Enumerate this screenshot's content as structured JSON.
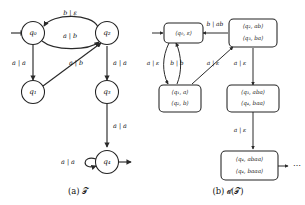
{
  "figure": {
    "panels": [
      {
        "id": "panel-a",
        "caption": "(a) 𝒯",
        "caption_plain": "(a) T",
        "type": "transducer-automaton",
        "states": [
          {
            "id": "q0",
            "label": "q₀",
            "initial": true,
            "accepting": false
          },
          {
            "id": "q1",
            "label": "q₁",
            "initial": false,
            "accepting": false
          },
          {
            "id": "q2",
            "label": "q₂",
            "initial": false,
            "accepting": false
          },
          {
            "id": "q3",
            "label": "q₃",
            "initial": false,
            "accepting": false
          },
          {
            "id": "q4",
            "label": "q₄",
            "initial": false,
            "accepting": true
          }
        ],
        "transitions": [
          {
            "from": "q2",
            "to": "q0",
            "label": "b | ε",
            "input": "b",
            "output": "ε",
            "shape": "curve-top"
          },
          {
            "from": "q0",
            "to": "q2",
            "label": "a | b",
            "input": "a",
            "output": "b",
            "shape": "curve-bottom"
          },
          {
            "from": "q0",
            "to": "q1",
            "label": "a | a",
            "input": "a",
            "output": "a",
            "shape": "straight-down"
          },
          {
            "from": "q1",
            "to": "q2",
            "label": "a | b",
            "input": "a",
            "output": "b",
            "shape": "diagonal-up-right"
          },
          {
            "from": "q2",
            "to": "q3",
            "label": "a | a",
            "input": "a",
            "output": "a",
            "shape": "straight-down"
          },
          {
            "from": "q3",
            "to": "q4",
            "label": "a | a",
            "input": "a",
            "output": "a",
            "shape": "straight-down"
          },
          {
            "from": "q4",
            "to": "q4",
            "label": "a | a",
            "input": "a",
            "output": "a",
            "shape": "self-loop-left"
          }
        ]
      },
      {
        "id": "panel-b",
        "caption": "(b) 𝒹(𝒯)",
        "caption_plain": "(b) D(T)",
        "type": "determinization-tree",
        "nodes": [
          {
            "id": "n0",
            "lines": [
              "⟨q₀, ε⟩"
            ],
            "initial": true
          },
          {
            "id": "n1",
            "lines": [
              "⟨q₂, ab⟩",
              "⟨q₃, ba⟩"
            ],
            "initial": false
          },
          {
            "id": "n2",
            "lines": [
              "⟨q₁, a⟩",
              "⟨q₂, b⟩"
            ],
            "initial": false
          },
          {
            "id": "n3",
            "lines": [
              "⟨q₃, aba⟩",
              "⟨q₄, baa⟩"
            ],
            "initial": false
          },
          {
            "id": "n4",
            "lines": [
              "⟨q₄, abaa⟩",
              "⟨q₄, baaa⟩"
            ],
            "initial": false
          }
        ],
        "edges": [
          {
            "from": "n1",
            "to": "n0",
            "label": "b | ab",
            "input": "b",
            "output": "ab",
            "shape": "horizontal-left"
          },
          {
            "from": "n0",
            "to": "n2",
            "label": "a | ε",
            "input": "a",
            "output": "ε",
            "shape": "curve-down-left"
          },
          {
            "from": "n2",
            "to": "n0",
            "label": "b | b",
            "input": "b",
            "output": "b",
            "shape": "curve-up-right"
          },
          {
            "from": "n2",
            "to": "n1",
            "label": "a | ε",
            "input": "a",
            "output": "ε",
            "shape": "diagonal-up-right"
          },
          {
            "from": "n1",
            "to": "n3",
            "label": "a | ε",
            "input": "a",
            "output": "ε",
            "shape": "straight-down"
          },
          {
            "from": "n3",
            "to": "n4",
            "label": "a | ε",
            "input": "a",
            "output": "ε",
            "shape": "straight-down"
          }
        ],
        "continuation": "⋯"
      }
    ]
  },
  "colors": {
    "background": "#ffffff",
    "stroke": "#222222",
    "text": "#111111"
  }
}
